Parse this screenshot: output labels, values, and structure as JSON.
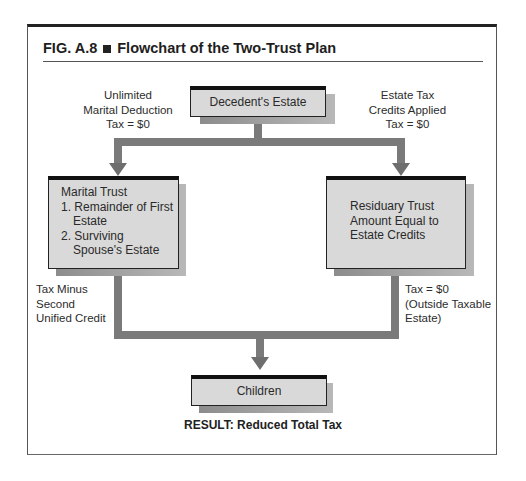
{
  "figure": {
    "number": "FIG. A.8",
    "separator_icon": "black-square",
    "title": "Flowchart of the Two-Trust Plan"
  },
  "nodes": {
    "decedent": {
      "label": "Decedent's Estate"
    },
    "marital": {
      "title": "Marital Trust",
      "items": [
        {
          "num": "1.",
          "line1": "Remainder of First",
          "line2": "Estate"
        },
        {
          "num": "2.",
          "line1": "Surviving",
          "line2": "Spouse's Estate"
        }
      ]
    },
    "residuary": {
      "lines": [
        "Residuary Trust",
        "Amount Equal to",
        "Estate Credits"
      ]
    },
    "children": {
      "label": "Children"
    }
  },
  "annotations": {
    "left_top": [
      "Unlimited",
      "Marital Deduction",
      "Tax = $0"
    ],
    "right_top": [
      "Estate Tax",
      "Credits Applied",
      "Tax = $0"
    ],
    "left_bottom": [
      "Tax Minus",
      "Second",
      "Unified Credit"
    ],
    "right_bottom": [
      "Tax = $0",
      "(Outside Taxable",
      "Estate)"
    ]
  },
  "result": "RESULT: Reduced Total Tax",
  "colors": {
    "box_fill": "#d9d9d9",
    "connector": "#7a7a7a",
    "box_top_bar": "#111111"
  }
}
